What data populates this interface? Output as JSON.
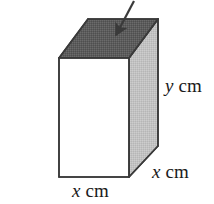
{
  "figure": {
    "kind": "geometry-diagram",
    "canvas": {
      "width": 214,
      "height": 204,
      "background": "#ffffff"
    },
    "solid": {
      "name": "cuboid",
      "faces": {
        "top": {
          "name": "top-face",
          "fill": "#5c5c5c",
          "shading": "dark-dithered"
        },
        "front": {
          "name": "front-face",
          "fill": "#ffffff",
          "shading": "none"
        },
        "side": {
          "name": "right-side-face",
          "fill": "#c2c2c2",
          "shading": "light-dithered"
        }
      },
      "edge_color": "#3a3a3a",
      "edge_width": 1.6
    },
    "arrow": {
      "name": "pointer-arrow",
      "color": "#3a3a3a",
      "tail": {
        "x": 134,
        "y": 1
      },
      "head": {
        "x": 114,
        "y": 38
      },
      "points_to": "top-face"
    },
    "labels": [
      {
        "id": "y-cm",
        "name": "height-label",
        "variable": "y",
        "unit": "cm",
        "text": "y cm",
        "edge": "vertical-height",
        "position": {
          "x": 165,
          "y": 76
        }
      },
      {
        "id": "x-depth",
        "name": "depth-label",
        "variable": "x",
        "unit": "cm",
        "text": "x cm",
        "edge": "base-depth",
        "position": {
          "x": 152,
          "y": 162
        }
      },
      {
        "id": "x-width",
        "name": "width-label",
        "variable": "x",
        "unit": "cm",
        "text": "x cm",
        "edge": "base-width",
        "position": {
          "x": 72,
          "y": 181
        }
      }
    ],
    "geometry": {
      "front_top_left": {
        "x": 59,
        "y": 58
      },
      "front_top_right": {
        "x": 129,
        "y": 58
      },
      "front_bottom_left": {
        "x": 59,
        "y": 177
      },
      "front_bottom_right": {
        "x": 129,
        "y": 177
      },
      "back_top_left": {
        "x": 88,
        "y": 19
      },
      "back_top_right": {
        "x": 158,
        "y": 19
      },
      "back_bottom_right": {
        "x": 158,
        "y": 146
      }
    }
  }
}
